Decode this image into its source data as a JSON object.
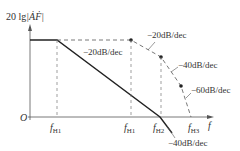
{
  "diagram": {
    "y_label_prefix": "20 lg",
    "y_label_var": "|ȦḞ|",
    "origin_label": "O",
    "x_label": "f",
    "freq_labels": {
      "fH1_a": "f",
      "fH1_a_sub": "H1",
      "fH1_b": "f",
      "fH1_b_sub": "H1",
      "fH2": "f",
      "fH2_sub": "H2",
      "fH3": "f",
      "fH3_sub": "H3"
    },
    "slope_labels": {
      "solid_minus20": "−20dB/dec",
      "dashed_minus20": "−20dB/dec",
      "dashed_minus40": "−40dB/dec",
      "dashed_minus60": "−60dB/dec",
      "solid_minus40": "−40dB/dec"
    },
    "colors": {
      "line": "#333333",
      "dashed": "#555555",
      "background": "#ffffff"
    }
  }
}
